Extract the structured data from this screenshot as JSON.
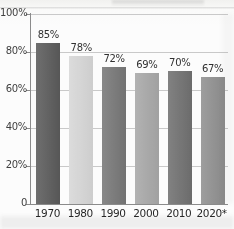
{
  "chart_data": {
    "type": "bar",
    "title": "",
    "xlabel": "",
    "ylabel": "",
    "categories": [
      "1970",
      "1980",
      "1990",
      "2000",
      "2010",
      "2020*"
    ],
    "values": [
      85,
      78,
      72,
      69,
      70,
      67
    ],
    "data_labels": [
      "85%",
      "78%",
      "72%",
      "69%",
      "70%",
      "67%"
    ],
    "ylim": [
      0,
      100
    ],
    "yticks": [
      0,
      20,
      40,
      60,
      80,
      100
    ],
    "ytick_labels": [
      "0",
      "20%",
      "40%",
      "60%",
      "80%",
      "100%"
    ],
    "grid": true,
    "grid_axis": "y",
    "legend": false,
    "bar_colors": [
      "#595959",
      "#d8d8d8",
      "#767676",
      "#a8a8a8",
      "#6f6f6f",
      "#8f8f8f"
    ],
    "footnote_marker": "*"
  },
  "colors": {
    "axis": "#8a8a8a",
    "gridline": "#c9c9c9",
    "label_text": "#2e2e2e",
    "tick_text": "#3d3d3d",
    "background": "#fdfdfd"
  }
}
